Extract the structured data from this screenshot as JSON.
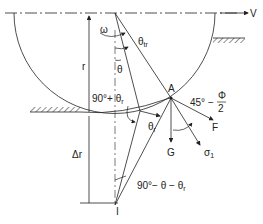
{
  "labels": {
    "velocity": "V",
    "omega": "ω",
    "theta_tr": "θ",
    "theta_tr_sub": "tr",
    "theta": "θ",
    "radius": "r",
    "angle_90_plus": "90°+ θ",
    "angle_90_plus_sub": "r",
    "point_A": "A",
    "angle_45": "45° −",
    "phi": "Φ",
    "two": "2",
    "theta_r": "θ",
    "theta_r_sub": "r",
    "force_F": "F",
    "force_G": "G",
    "sigma": "σ",
    "sigma_sub": "1",
    "delta_r": "Δr",
    "angle_90_minus": "90°− θ − θ",
    "angle_90_minus_sub": "r",
    "point_I": "I"
  }
}
